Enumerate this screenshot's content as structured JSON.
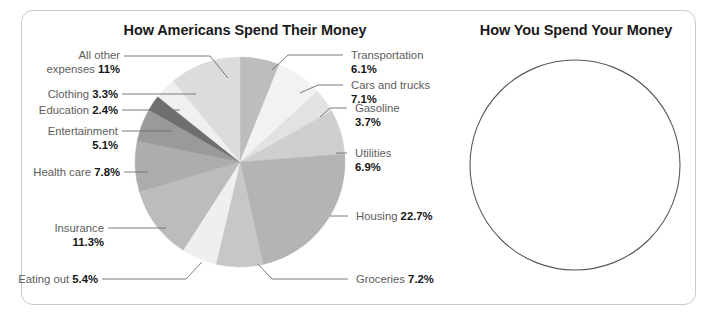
{
  "frame": {
    "border_color": "#c9c9c9",
    "background": "#ffffff"
  },
  "left_panel": {
    "title": "How Americans Spend Their Money"
  },
  "right_panel": {
    "title": "How You Spend Your Money",
    "circle": {
      "empty": true,
      "stroke": "#595959",
      "cx": 575,
      "cy": 165,
      "r": 105
    }
  },
  "chart_data": {
    "type": "pie",
    "title": "How Americans Spend Their Money",
    "unit": "percent",
    "start_angle_deg": 0,
    "direction": "clockwise",
    "center": {
      "x": 240,
      "y": 162
    },
    "radius": 105,
    "categories": [
      "Transportation",
      "Cars and trucks",
      "Gasoline",
      "Utilities",
      "Housing",
      "Groceries",
      "Eating out",
      "Insurance",
      "Health care",
      "Entertainment",
      "Education",
      "Clothing",
      "All other expenses"
    ],
    "values": [
      6.1,
      7.1,
      3.7,
      6.9,
      22.7,
      7.2,
      5.4,
      11.3,
      7.8,
      5.1,
      2.4,
      3.3,
      11.0
    ],
    "value_labels": [
      "6.1%",
      "7.1%",
      "3.7%",
      "6.9%",
      "22.7%",
      "7.2%",
      "5.4%",
      "11.3%",
      "7.8%",
      "5.1%",
      "2.4%",
      "3.3%",
      "11%"
    ],
    "colors": [
      "#bdbdbd",
      "#f2f2f2",
      "#e2e2e2",
      "#cfcfcf",
      "#b4b4b4",
      "#c7c7c7",
      "#efefef",
      "#bcbcbc",
      "#adadad",
      "#9a9a9a",
      "#6f6f6f",
      "#f0f0f0",
      "#dcdcdc"
    ],
    "slices": [
      {
        "label": "Transportation",
        "value": 6.1,
        "value_text": "6.1%",
        "color": "#bdbdbd",
        "label_side": "right"
      },
      {
        "label": "Cars and trucks",
        "value": 7.1,
        "value_text": "7.1%",
        "color": "#f2f2f2",
        "label_side": "right"
      },
      {
        "label": "Gasoline",
        "value": 3.7,
        "value_text": "3.7%",
        "color": "#e2e2e2",
        "label_side": "right"
      },
      {
        "label": "Utilities",
        "value": 6.9,
        "value_text": "6.9%",
        "color": "#cfcfcf",
        "label_side": "right"
      },
      {
        "label": "Housing",
        "value": 22.7,
        "value_text": "22.7%",
        "color": "#b4b4b4",
        "label_side": "right"
      },
      {
        "label": "Groceries",
        "value": 7.2,
        "value_text": "7.2%",
        "color": "#c7c7c7",
        "label_side": "right"
      },
      {
        "label": "Eating out",
        "value": 5.4,
        "value_text": "5.4%",
        "color": "#efefef",
        "label_side": "left"
      },
      {
        "label": "Insurance",
        "value": 11.3,
        "value_text": "11.3%",
        "color": "#bcbcbc",
        "label_side": "left"
      },
      {
        "label": "Health care",
        "value": 7.8,
        "value_text": "7.8%",
        "color": "#adadad",
        "label_side": "left"
      },
      {
        "label": "Entertainment",
        "value": 5.1,
        "value_text": "5.1%",
        "color": "#9a9a9a",
        "label_side": "left"
      },
      {
        "label": "Education",
        "value": 2.4,
        "value_text": "2.4%",
        "color": "#6f6f6f",
        "label_side": "left"
      },
      {
        "label": "Clothing",
        "value": 3.3,
        "value_text": "3.3%",
        "color": "#f0f0f0",
        "label_side": "left"
      },
      {
        "label": "All other expenses",
        "value": 11.0,
        "value_text": "11%",
        "color": "#dcdcdc",
        "label_side": "left"
      }
    ],
    "legend": "none",
    "grid": false
  },
  "labels": {
    "all_other_l1": "All other",
    "all_other_l2_pre": "expenses ",
    "all_other_l2_val": "11%",
    "clothing_pre": "Clothing ",
    "clothing_val": "3.3%",
    "education_pre": "Education ",
    "education_val": "2.4%",
    "entertainment_l1": "Entertainment",
    "entertainment_val": "5.1%",
    "healthcare_pre": "Health care ",
    "healthcare_val": "7.8%",
    "insurance_l1": "Insurance",
    "insurance_val": "11.3%",
    "eatingout_pre": "Eating out ",
    "eatingout_val": "5.4%",
    "groceries_pre": "Groceries ",
    "groceries_val": "7.2%",
    "housing_pre": "Housing ",
    "housing_val": "22.7%",
    "utilities_l1": "Utilities",
    "utilities_val": "6.9%",
    "gasoline_l1": "Gasoline",
    "gasoline_val": "3.7%",
    "cars_l1": "Cars and trucks",
    "cars_val": "7.1%",
    "transportation_l1": "Transportation",
    "transportation_val": "6.1%"
  }
}
